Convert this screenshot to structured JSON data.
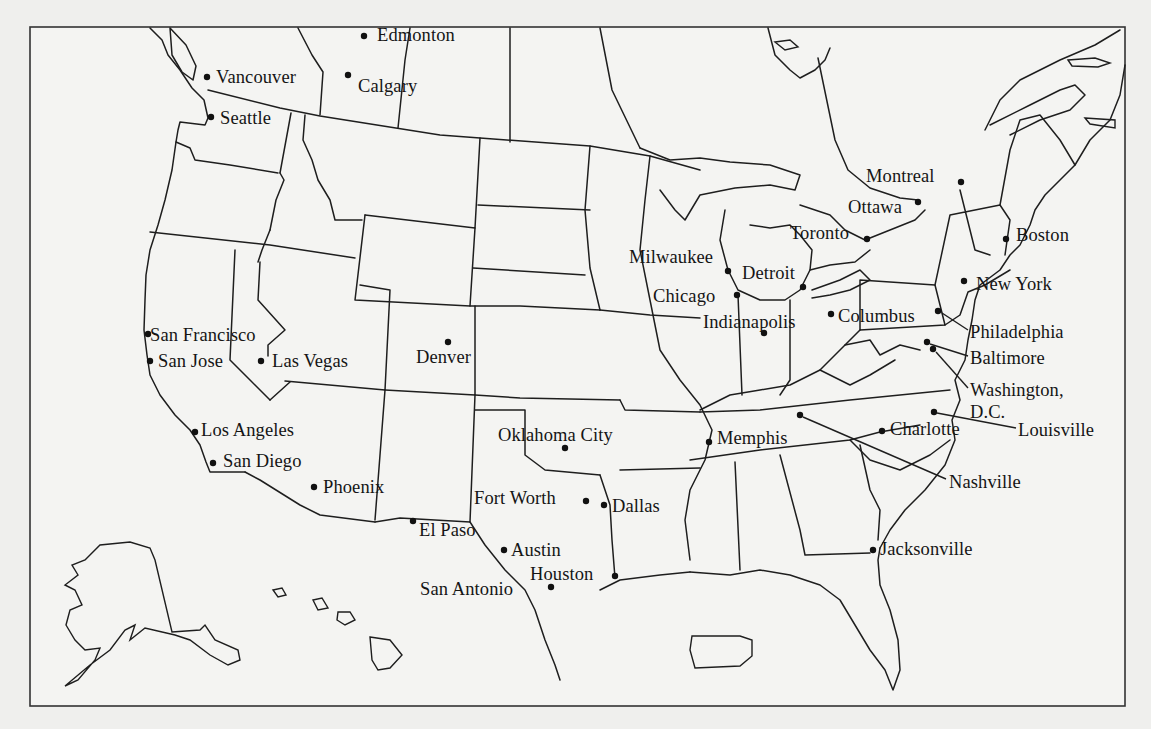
{
  "map": {
    "type": "outline map",
    "region": "United States and southern Canada",
    "frame": {
      "x": 30,
      "y": 27,
      "w": 1095,
      "h": 679
    },
    "colors": {
      "background": "#efefed",
      "paper": "#f4f4f2",
      "ink": "#1e1e1e"
    }
  },
  "cities": [
    {
      "name": "Edmonton",
      "dot": [
        364,
        36
      ],
      "label": [
        377,
        26
      ]
    },
    {
      "name": "Vancouver",
      "dot": [
        207,
        77
      ],
      "label": [
        216,
        68
      ]
    },
    {
      "name": "Calgary",
      "dot": [
        348,
        75
      ],
      "label": [
        358,
        77
      ]
    },
    {
      "name": "Seattle",
      "dot": [
        211,
        117
      ],
      "label": [
        220,
        109
      ]
    },
    {
      "name": "Montreal",
      "dot": [
        961,
        182
      ],
      "label": [
        866,
        167
      ]
    },
    {
      "name": "Ottawa",
      "dot": [
        918,
        202
      ],
      "label": [
        848,
        198
      ]
    },
    {
      "name": "Toronto",
      "dot": [
        867,
        239
      ],
      "label": [
        790,
        224
      ]
    },
    {
      "name": "Boston",
      "dot": [
        1006,
        239
      ],
      "label": [
        1016,
        226
      ]
    },
    {
      "name": "Milwaukee",
      "dot": [
        728,
        271
      ],
      "label": [
        629,
        248
      ]
    },
    {
      "name": "Detroit",
      "dot": [
        803,
        287
      ],
      "label": [
        742,
        264
      ]
    },
    {
      "name": "New York",
      "dot": [
        964,
        281
      ],
      "label": [
        976,
        275
      ]
    },
    {
      "name": "Chicago",
      "dot": [
        737,
        295
      ],
      "label": [
        653,
        287
      ]
    },
    {
      "name": "Indianapolis",
      "dot": [
        764,
        333
      ],
      "label": [
        703,
        313
      ]
    },
    {
      "name": "Columbus",
      "dot": [
        831,
        314
      ],
      "label": [
        838,
        307
      ]
    },
    {
      "name": "Philadelphia",
      "dot": [
        938,
        311
      ],
      "label": [
        970,
        323
      ],
      "leader": [
        [
          942,
          313
        ],
        [
          968,
          330
        ]
      ]
    },
    {
      "name": "Baltimore",
      "dot": [
        927,
        342
      ],
      "label": [
        970,
        349
      ],
      "leader": [
        [
          930,
          344
        ],
        [
          968,
          356
        ]
      ]
    },
    {
      "name": "Washington, D.C.",
      "dot": [
        933,
        349
      ],
      "label": [
        970,
        381
      ],
      "label2": "D.C.",
      "label2_pos": [
        970,
        403
      ],
      "leader": [
        [
          936,
          352
        ],
        [
          968,
          388
        ]
      ]
    },
    {
      "name": "San Francisco",
      "dot": [
        148,
        334
      ],
      "label": [
        150,
        326
      ]
    },
    {
      "name": "San Jose",
      "dot": [
        150,
        361
      ],
      "label": [
        158,
        352
      ]
    },
    {
      "name": "Las Vegas",
      "dot": [
        261,
        361
      ],
      "label": [
        272,
        352
      ]
    },
    {
      "name": "Denver",
      "dot": [
        448,
        342
      ],
      "label": [
        416,
        348
      ]
    },
    {
      "name": "Los Angeles",
      "dot": [
        195,
        432
      ],
      "label": [
        201,
        421
      ]
    },
    {
      "name": "San Diego",
      "dot": [
        213,
        463
      ],
      "label": [
        223,
        452
      ]
    },
    {
      "name": "Phoenix",
      "dot": [
        314,
        487
      ],
      "label": [
        323,
        478
      ]
    },
    {
      "name": "Oklahoma City",
      "dot": [
        565,
        448
      ],
      "label": [
        498,
        426
      ]
    },
    {
      "name": "Memphis",
      "dot": [
        709,
        442
      ],
      "label": [
        717,
        429
      ]
    },
    {
      "name": "Charlotte",
      "dot": [
        882,
        431
      ],
      "label": [
        890,
        420
      ]
    },
    {
      "name": "Louisville",
      "dot": [
        934,
        412
      ],
      "label": [
        1018,
        421
      ],
      "leader": [
        [
          937,
          413
        ],
        [
          1016,
          428
        ]
      ]
    },
    {
      "name": "Nashville",
      "dot": [
        800,
        415
      ],
      "label": [
        949,
        473
      ],
      "leader": [
        [
          803,
          417
        ],
        [
          946,
          479
        ]
      ]
    },
    {
      "name": "Fort Worth",
      "dot": [
        586,
        501
      ],
      "label": [
        474,
        489
      ]
    },
    {
      "name": "Dallas",
      "dot": [
        604,
        505
      ],
      "label": [
        612,
        497
      ]
    },
    {
      "name": "El Paso",
      "dot": [
        413,
        521
      ],
      "label": [
        419,
        521
      ]
    },
    {
      "name": "Austin",
      "dot": [
        504,
        550
      ],
      "label": [
        511,
        541
      ]
    },
    {
      "name": "Jacksonville",
      "dot": [
        873,
        550
      ],
      "label": [
        880,
        540
      ]
    },
    {
      "name": "Houston",
      "dot": [
        615,
        576
      ],
      "label": [
        530,
        565
      ]
    },
    {
      "name": "San Antonio",
      "dot": [
        551,
        587
      ],
      "label": [
        420,
        580
      ]
    }
  ]
}
